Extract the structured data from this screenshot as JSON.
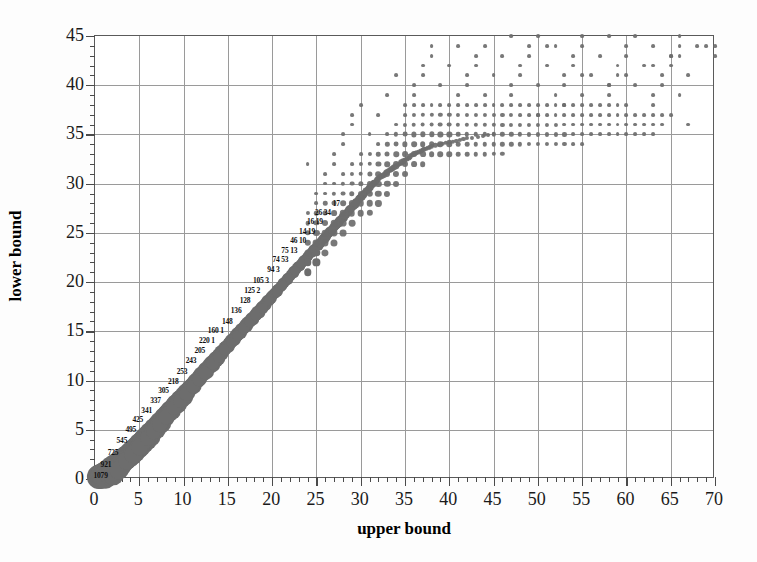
{
  "chart_data": {
    "type": "scatter",
    "title": "",
    "subtitle": "",
    "xlabel": "upper bound",
    "ylabel": "lower bound",
    "xlim": [
      0,
      70
    ],
    "ylim": [
      0,
      45
    ],
    "xticks": [
      0,
      5,
      10,
      15,
      20,
      25,
      30,
      35,
      40,
      45,
      50,
      55,
      60,
      65,
      70
    ],
    "yticks": [
      0,
      5,
      10,
      15,
      20,
      25,
      30,
      35,
      40,
      45
    ],
    "x_minor_tick_step": 1,
    "y_minor_tick_step": 1,
    "grid": "major gridlines on both axes",
    "legend": "none",
    "marker_encoding": "marker area proportional to frequency count; counts printed beside the left flank of the dense band",
    "marker_color": "#6d6d6d",
    "annotations": [
      {
        "label": "1079",
        "x": 2.0,
        "y": 0.4
      },
      {
        "label": "921",
        "x": 2.4,
        "y": 1.5
      },
      {
        "label": "725",
        "x": 3.2,
        "y": 2.7
      },
      {
        "label": "545",
        "x": 4.2,
        "y": 4.0
      },
      {
        "label": "495",
        "x": 5.2,
        "y": 5.1
      },
      {
        "label": "425",
        "x": 6.0,
        "y": 6.1
      },
      {
        "label": "341",
        "x": 7.0,
        "y": 7.0
      },
      {
        "label": "337",
        "x": 8.0,
        "y": 8.0
      },
      {
        "label": "305",
        "x": 8.9,
        "y": 9.0
      },
      {
        "label": "218",
        "x": 10.0,
        "y": 10.0
      },
      {
        "label": "253",
        "x": 11.0,
        "y": 11.0
      },
      {
        "label": "243",
        "x": 12.0,
        "y": 12.1
      },
      {
        "label": "205",
        "x": 13.0,
        "y": 13.1
      },
      {
        "label": "220 1",
        "x": 14.1,
        "y": 14.1
      },
      {
        "label": "160 1",
        "x": 15.1,
        "y": 15.1
      },
      {
        "label": "148",
        "x": 16.1,
        "y": 16.1
      },
      {
        "label": "136",
        "x": 17.1,
        "y": 17.2
      },
      {
        "label": "128",
        "x": 18.1,
        "y": 18.2
      },
      {
        "label": "125 2",
        "x": 19.2,
        "y": 19.2
      },
      {
        "label": "105 3",
        "x": 20.2,
        "y": 20.2
      },
      {
        "label": "94 3",
        "x": 21.4,
        "y": 21.3
      },
      {
        "label": "74 53",
        "x": 22.4,
        "y": 22.3
      },
      {
        "label": "75 13",
        "x": 23.4,
        "y": 23.3
      },
      {
        "label": "46 10",
        "x": 24.4,
        "y": 24.3
      },
      {
        "label": "14 19",
        "x": 25.4,
        "y": 25.2
      },
      {
        "label": "16 19",
        "x": 26.3,
        "y": 26.2
      },
      {
        "label": "26 34",
        "x": 27.2,
        "y": 27.1
      },
      {
        "label": "17",
        "x": 28.2,
        "y": 28.0
      }
    ],
    "points": [
      {
        "x": 0.5,
        "y": 0.2,
        "n": 1079
      },
      {
        "x": 1.1,
        "y": 0.5,
        "n": 1079
      },
      {
        "x": 1.8,
        "y": 0.9,
        "n": 980
      },
      {
        "x": 2.5,
        "y": 1.4,
        "n": 921
      },
      {
        "x": 3.2,
        "y": 2.0,
        "n": 860
      },
      {
        "x": 3.9,
        "y": 2.6,
        "n": 800
      },
      {
        "x": 4.6,
        "y": 3.2,
        "n": 725
      },
      {
        "x": 5.3,
        "y": 3.9,
        "n": 660
      },
      {
        "x": 6.0,
        "y": 4.6,
        "n": 600
      },
      {
        "x": 6.7,
        "y": 5.3,
        "n": 545
      },
      {
        "x": 7.4,
        "y": 6.0,
        "n": 510
      },
      {
        "x": 8.1,
        "y": 6.7,
        "n": 495
      },
      {
        "x": 8.8,
        "y": 7.4,
        "n": 460
      },
      {
        "x": 9.5,
        "y": 8.1,
        "n": 425
      },
      {
        "x": 10.2,
        "y": 8.8,
        "n": 390
      },
      {
        "x": 10.9,
        "y": 9.5,
        "n": 341
      },
      {
        "x": 11.6,
        "y": 10.2,
        "n": 337
      },
      {
        "x": 12.3,
        "y": 10.9,
        "n": 320
      },
      {
        "x": 13.0,
        "y": 11.6,
        "n": 305
      },
      {
        "x": 13.7,
        "y": 12.3,
        "n": 280
      },
      {
        "x": 14.4,
        "y": 13.0,
        "n": 253
      },
      {
        "x": 15.1,
        "y": 13.7,
        "n": 243
      },
      {
        "x": 15.8,
        "y": 14.4,
        "n": 230
      },
      {
        "x": 16.5,
        "y": 15.1,
        "n": 220
      },
      {
        "x": 17.2,
        "y": 15.8,
        "n": 205
      },
      {
        "x": 17.9,
        "y": 16.5,
        "n": 190
      },
      {
        "x": 18.6,
        "y": 17.2,
        "n": 175
      },
      {
        "x": 19.3,
        "y": 17.9,
        "n": 160
      },
      {
        "x": 20.0,
        "y": 18.6,
        "n": 148
      },
      {
        "x": 20.7,
        "y": 19.3,
        "n": 140
      },
      {
        "x": 21.4,
        "y": 20.0,
        "n": 136
      },
      {
        "x": 22.1,
        "y": 20.7,
        "n": 128
      },
      {
        "x": 22.8,
        "y": 21.4,
        "n": 125
      },
      {
        "x": 23.5,
        "y": 22.1,
        "n": 115
      },
      {
        "x": 24.2,
        "y": 22.8,
        "n": 105
      },
      {
        "x": 24.9,
        "y": 23.5,
        "n": 98
      },
      {
        "x": 25.6,
        "y": 24.2,
        "n": 94
      },
      {
        "x": 26.3,
        "y": 24.9,
        "n": 85
      },
      {
        "x": 27.0,
        "y": 25.6,
        "n": 75
      },
      {
        "x": 27.7,
        "y": 26.3,
        "n": 74
      },
      {
        "x": 28.4,
        "y": 27.0,
        "n": 60
      },
      {
        "x": 29.1,
        "y": 27.7,
        "n": 53
      },
      {
        "x": 29.8,
        "y": 28.4,
        "n": 46
      },
      {
        "x": 30.5,
        "y": 29.1,
        "n": 34
      },
      {
        "x": 31.2,
        "y": 29.8,
        "n": 26
      },
      {
        "x": 32.0,
        "y": 30.5,
        "n": 19
      },
      {
        "x": 33.0,
        "y": 31.2,
        "n": 17
      },
      {
        "x": 34.0,
        "y": 31.8,
        "n": 14
      },
      {
        "x": 35.0,
        "y": 32.4,
        "n": 10
      },
      {
        "x": 36.0,
        "y": 33.0,
        "n": 8
      },
      {
        "x": 37.0,
        "y": 33.4,
        "n": 6
      },
      {
        "x": 38.0,
        "y": 33.8,
        "n": 4
      },
      {
        "x": 40.0,
        "y": 34.2,
        "n": 3
      },
      {
        "x": 42.0,
        "y": 34.6,
        "n": 2
      },
      {
        "x": 45.0,
        "y": 35.0,
        "n": 1
      }
    ]
  },
  "axes": {
    "x_title": "upper bound",
    "y_title": "lower bound",
    "x_tick_labels": [
      "0",
      "5",
      "10",
      "15",
      "20",
      "25",
      "30",
      "35",
      "40",
      "45",
      "50",
      "55",
      "60",
      "65",
      "70"
    ],
    "y_tick_labels": [
      "0",
      "5",
      "10",
      "15",
      "20",
      "25",
      "30",
      "35",
      "40",
      "45"
    ]
  }
}
